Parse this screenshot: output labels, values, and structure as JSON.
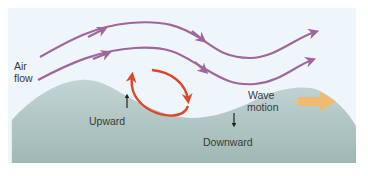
{
  "diagram": {
    "labels": {
      "air_flow_line1": "Air",
      "air_flow_line2": "flow",
      "upward": "Upward",
      "downward": "Downward",
      "wave_motion_line1": "Wave",
      "wave_motion_line2": "motion"
    },
    "colors": {
      "sky_background": "#eef5fb",
      "terrain_fill": "#a9c0bc",
      "terrain_fill_light": "#c7d8d6",
      "airflow_arrows": "#a0669a",
      "circulation_arrow": "#e0462a",
      "wave_motion_arrow": "#f2b86a",
      "small_arrows": "#222222",
      "text": "#3a3a3a"
    },
    "elements": {
      "airflow_lines": 2,
      "circulation": "clockwise eddy in trough",
      "wave_direction": "right"
    }
  }
}
